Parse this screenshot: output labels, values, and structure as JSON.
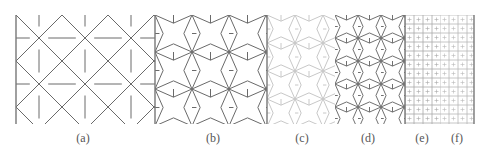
{
  "figure": {
    "panels": [
      {
        "id": "a",
        "label": "(a)",
        "x0": 16,
        "x1": 155,
        "cell": 46,
        "color": "#6a6a6a",
        "style": "arrow-x",
        "label_x": 83
      },
      {
        "id": "b",
        "label": "(b)",
        "x0": 155,
        "x1": 267,
        "cell": 37,
        "color": "#6a6a6a",
        "style": "star",
        "label_x": 213
      },
      {
        "id": "c",
        "label": "(c)",
        "x0": 267,
        "x1": 335,
        "cell": 28,
        "color": "#c8c8c8",
        "style": "star",
        "label_x": 302
      },
      {
        "id": "d",
        "label": "(d)",
        "x0": 335,
        "x1": 405,
        "cell": 23,
        "color": "#707070",
        "style": "star",
        "label_x": 368
      },
      {
        "id": "e",
        "label": "(e)",
        "x0": 405,
        "x1": 440,
        "cell": 9,
        "color": "#a8a8a8",
        "style": "grid",
        "label_x": 422
      },
      {
        "id": "f",
        "label": "(f)",
        "x0": 440,
        "x1": 474,
        "cell": 9,
        "color": "#b8b8b8",
        "style": "grid",
        "label_x": 457
      }
    ],
    "y0": 15,
    "y1": 124,
    "border_color": "#777777"
  }
}
